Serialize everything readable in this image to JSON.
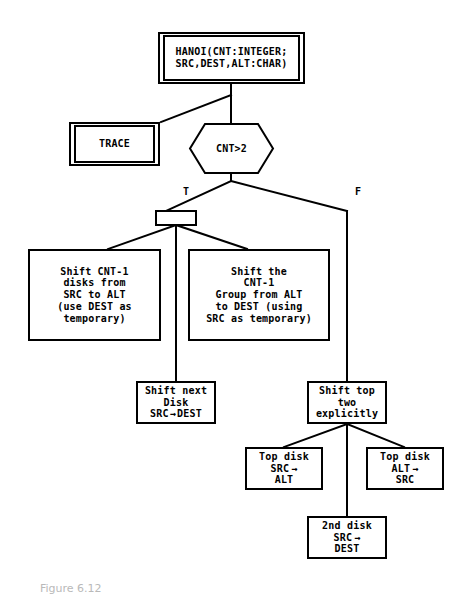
{
  "diagram": {
    "title_caption": "Figure 6.12",
    "type": "structure-chart",
    "nodes": {
      "root": {
        "label": "HANOI(CNT:INTEGER;\nSRC,DEST,ALT:CHAR)",
        "shape": "double-rectangle"
      },
      "trace": {
        "label": "TRACE",
        "shape": "double-rectangle"
      },
      "decision": {
        "label": "CNT>2",
        "shape": "hexagon"
      },
      "junction": {
        "label": "",
        "shape": "rectangle"
      },
      "shift_cnt_minus_1": {
        "label": "Shift CNT-1\ndisks from\nSRC to ALT\n(use DEST as\ntemporary)",
        "shape": "rectangle"
      },
      "shift_the_group": {
        "label": "Shift the\nCNT-1\nGroup from ALT\nto DEST (using\nSRC as temporary)",
        "shape": "rectangle"
      },
      "shift_next_disk": {
        "line1": "Shift next",
        "line2": "Disk",
        "from": "SRC",
        "arrow": "→",
        "to": "DEST",
        "shape": "rectangle"
      },
      "shift_top_two": {
        "label": "Shift top\ntwo\nexplicitly",
        "shape": "rectangle"
      },
      "top_disk_src_alt": {
        "line1": "Top disk",
        "from": "SRC",
        "arrow": "→",
        "to": "ALT",
        "shape": "rectangle"
      },
      "top_disk_alt_src": {
        "line1": "Top disk",
        "from": "ALT",
        "arrow": "→",
        "to": "SRC",
        "shape": "rectangle"
      },
      "second_disk_src_dest": {
        "line1": "2nd disk",
        "from": "SRC",
        "arrow": "→",
        "to": "DEST",
        "shape": "rectangle"
      }
    },
    "branch_labels": {
      "true": "T",
      "false": "F"
    }
  }
}
